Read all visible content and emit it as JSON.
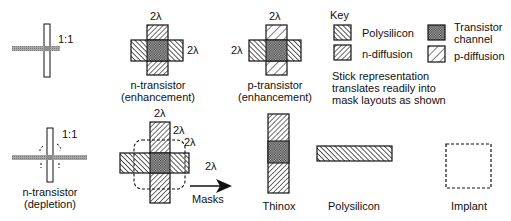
{
  "diagram": {
    "panels": {
      "stick_enh": {
        "ratio": "1:1"
      },
      "n_enh": {
        "dim_top": "2λ",
        "dim_right": "2λ",
        "caption_line1": "n-transistor",
        "caption_line2": "(enhancement)"
      },
      "p_enh": {
        "dim_top": "2λ",
        "dim_left": "2λ",
        "caption_line1": "p-transistor",
        "caption_line2": "(enhancement)"
      },
      "stick_dep": {
        "ratio": "1:1",
        "caption_line1": "n-transistor",
        "caption_line2": "(depletion)"
      },
      "n_dep": {
        "dim_top": "2λ",
        "dim_right1": "2λ",
        "dim_right2": "2λ",
        "dim_right3": "2λ"
      }
    },
    "key": {
      "title": "Key",
      "items": [
        {
          "label": "Polysilicon",
          "pattern": "hatch-backslash"
        },
        {
          "label": "n-diffusion",
          "pattern": "hatch-slash"
        },
        {
          "label_line1": "Transistor",
          "label_line2": "channel",
          "pattern": "crosshatch"
        },
        {
          "label": "p-diffusion",
          "pattern": "hatch-slash-wide"
        }
      ],
      "note_line1": "Stick representation",
      "note_line2": "translates readily into",
      "note_line3": "mask layouts as shown"
    },
    "masks": {
      "arrow_label": "Masks",
      "items": [
        {
          "label": "Thinox"
        },
        {
          "label": "Polysilicon"
        },
        {
          "label": "Implant"
        }
      ]
    },
    "colors": {
      "stroke": "#111111",
      "stick_poly": "#9a9a9a",
      "background": "#ffffff"
    }
  }
}
